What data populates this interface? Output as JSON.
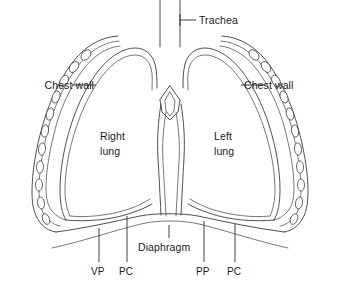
{
  "figure": {
    "background_color": "#ffffff",
    "line_color": "#3c3c42",
    "text_color": "#1a1a1a"
  },
  "labels": {
    "trachea": "Trachea",
    "chest_wall_left": "Chest wall",
    "chest_wall_right": "Chest wall",
    "right_lung_line1": "Right",
    "right_lung_line2": "lung",
    "left_lung_line1": "Left",
    "left_lung_line2": "lung",
    "diaphragm": "Diaphragm",
    "vp": "VP",
    "pc_left": "PC",
    "pp": "PP",
    "pc_right": "PC"
  },
  "abbreviations": [
    {
      "code": "VP",
      "position": "lower-left"
    },
    {
      "code": "PC",
      "position": "lower-left-inner"
    },
    {
      "code": "PP",
      "position": "lower-right-inner"
    },
    {
      "code": "PC",
      "position": "lower-right"
    }
  ],
  "structures": [
    "trachea",
    "right lung",
    "left lung",
    "chest wall",
    "ribs",
    "pleural membranes",
    "mediastinum",
    "diaphragm"
  ]
}
